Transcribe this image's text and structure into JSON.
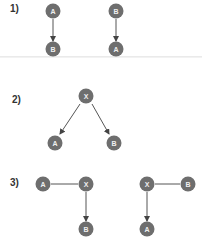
{
  "colors": {
    "node": "#6e6e6e",
    "edge": "#555555",
    "label": "#333333",
    "node_text": "#f0f0f0"
  },
  "sections": [
    {
      "label": "1)",
      "label_pos": [
        10,
        7
      ],
      "diagrams": [
        {
          "nodes": [
            {
              "id": "A",
              "x": 53,
              "y": 11
            },
            {
              "id": "B",
              "x": 53,
              "y": 49
            }
          ],
          "edges": [
            {
              "from": [
                53,
                19
              ],
              "to": [
                53,
                41
              ],
              "arrow": true
            }
          ]
        },
        {
          "nodes": [
            {
              "id": "B",
              "x": 116,
              "y": 11
            },
            {
              "id": "A",
              "x": 116,
              "y": 49
            }
          ],
          "edges": [
            {
              "from": [
                116,
                19
              ],
              "to": [
                116,
                41
              ],
              "arrow": true
            }
          ]
        }
      ]
    },
    {
      "label": "2)",
      "label_pos": [
        12,
        99
      ],
      "diagrams": [
        {
          "nodes": [
            {
              "id": "X",
              "x": 86,
              "y": 96
            },
            {
              "id": "A",
              "x": 55,
              "y": 143
            },
            {
              "id": "B",
              "x": 114,
              "y": 143
            }
          ],
          "edges": [
            {
              "from": [
                80,
                104
              ],
              "to": [
                60,
                134
              ],
              "arrow": true
            },
            {
              "from": [
                92,
                104
              ],
              "to": [
                109,
                134
              ],
              "arrow": true
            }
          ]
        }
      ]
    },
    {
      "label": "3)",
      "label_pos": [
        10,
        179
      ],
      "diagrams": [
        {
          "nodes": [
            {
              "id": "A",
              "x": 43,
              "y": 184
            },
            {
              "id": "X",
              "x": 86,
              "y": 184
            },
            {
              "id": "B",
              "x": 86,
              "y": 229
            }
          ],
          "edges": [
            {
              "from": [
                51,
                184
              ],
              "to": [
                78,
                184
              ],
              "arrow": false
            },
            {
              "from": [
                86,
                192
              ],
              "to": [
                86,
                221
              ],
              "arrow": true
            }
          ]
        },
        {
          "nodes": [
            {
              "id": "X",
              "x": 147,
              "y": 184
            },
            {
              "id": "B",
              "x": 188,
              "y": 184
            },
            {
              "id": "A",
              "x": 147,
              "y": 229
            }
          ],
          "edges": [
            {
              "from": [
                155,
                184
              ],
              "to": [
                180,
                184
              ],
              "arrow": false
            },
            {
              "from": [
                147,
                192
              ],
              "to": [
                147,
                221
              ],
              "arrow": true
            }
          ]
        }
      ]
    }
  ]
}
